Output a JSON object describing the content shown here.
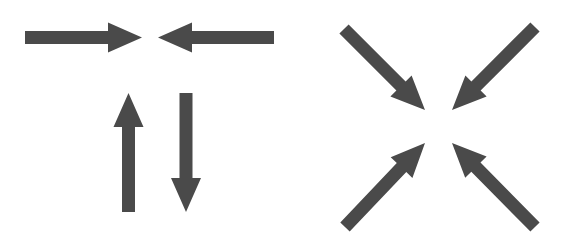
{
  "diagram": {
    "fill_color": "#4a4a4a",
    "background": "#ffffff",
    "groups": [
      {
        "name": "orthogonal-arrows",
        "arrows": [
          {
            "name": "arrow-right",
            "direction": "right",
            "from": [
              25,
              37.5
            ],
            "to": [
              142,
              37.5
            ]
          },
          {
            "name": "arrow-left",
            "direction": "left",
            "from": [
              274,
              37.5
            ],
            "to": [
              158,
              37.5
            ]
          },
          {
            "name": "arrow-up",
            "direction": "up",
            "from": [
              128.5,
              212
            ],
            "to": [
              128.5,
              93
            ]
          },
          {
            "name": "arrow-down",
            "direction": "down",
            "from": [
              186,
              93
            ],
            "to": [
              186,
              212
            ]
          }
        ]
      },
      {
        "name": "diagonal-arrows",
        "arrows": [
          {
            "name": "arrow-down-right",
            "direction": "down-right",
            "from": [
              344,
              29
            ],
            "to": [
              425,
              110
            ]
          },
          {
            "name": "arrow-down-left",
            "direction": "down-left",
            "from": [
              535,
              27
            ],
            "to": [
              452,
              110
            ]
          },
          {
            "name": "arrow-up-right",
            "direction": "up-right",
            "from": [
              345,
              227
            ],
            "to": [
              425,
              143
            ]
          },
          {
            "name": "arrow-up-left",
            "direction": "up-left",
            "from": [
              535,
              227
            ],
            "to": [
              452,
              143
            ]
          }
        ]
      }
    ],
    "shaft_width": 13,
    "head_width": 30,
    "head_length": 34
  }
}
